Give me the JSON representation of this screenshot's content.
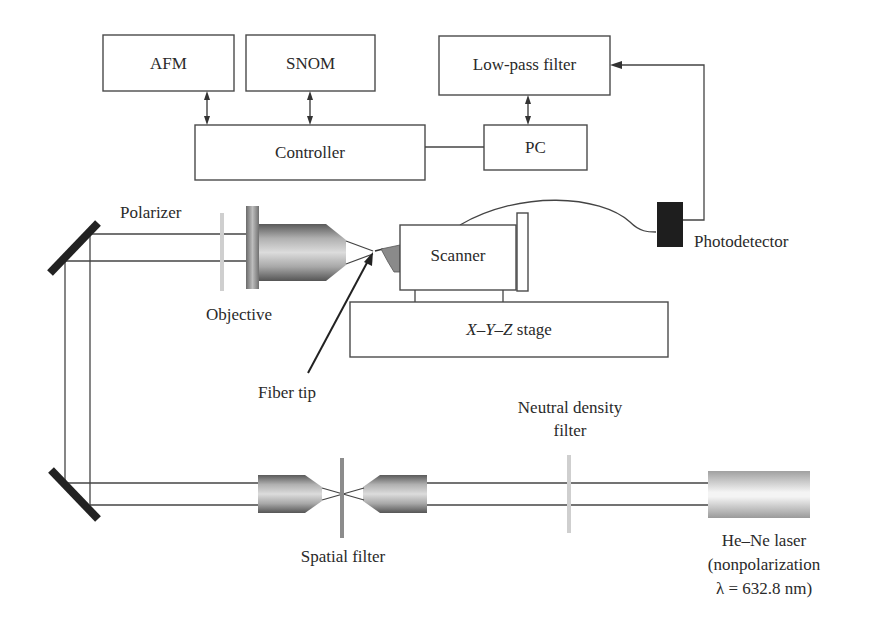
{
  "diagram": {
    "blocks": {
      "afm": "AFM",
      "snom": "SNOM",
      "lowpass": "Low-pass filter",
      "controller": "Controller",
      "pc": "PC",
      "scanner": "Scanner",
      "stage_x": "X",
      "stage_y": "Y",
      "stage_z": "Z",
      "stage_dash": "–",
      "stage_suffix": " stage"
    },
    "labels": {
      "polarizer": "Polarizer",
      "objective": "Objective",
      "fiber_tip": "Fiber tip",
      "photodetector": "Photodetector",
      "nd_filter_line1": "Neutral density",
      "nd_filter_line2": "filter",
      "spatial_filter": "Spatial filter",
      "laser_line1": "He–Ne laser",
      "laser_line2": "(nonpolarization",
      "laser_line3": "λ = 632.8 nm)"
    },
    "colors": {
      "line": "#444444",
      "mirror": "#222222",
      "photodetector": "#1e1e1e",
      "filter": "#c8c8c8",
      "tip": "#8a8a8a"
    }
  }
}
